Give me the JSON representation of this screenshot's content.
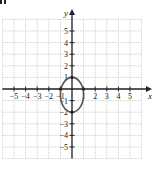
{
  "problem_label_fragment": "y.",
  "chart_data": {
    "type": "line",
    "title": "",
    "xlabel": "x",
    "ylabel": "y",
    "xlim": [
      -6,
      6
    ],
    "ylim": [
      -6,
      6
    ],
    "grid": true,
    "x_ticks": [
      -5,
      -4,
      -3,
      -2,
      -1,
      1,
      2,
      3,
      4,
      5
    ],
    "y_ticks": [
      5,
      4,
      3,
      2,
      1,
      -1,
      -2,
      -3,
      -4,
      -5
    ],
    "x_tick_labels": [
      "−5",
      "−4",
      "−3",
      "−2",
      "−1",
      "1",
      "2",
      "3",
      "4",
      "5"
    ],
    "y_tick_labels": [
      "5",
      "4",
      "3",
      "2",
      "1",
      "−1",
      "−2",
      "−3",
      "−4",
      "−5"
    ],
    "series": [
      {
        "name": "ellipse",
        "shape": "ellipse",
        "center": [
          0,
          -0.5
        ],
        "semi_axis_x": 1,
        "semi_axis_y": 1.5,
        "vertices": [
          [
            0,
            1
          ],
          [
            0,
            -2
          ],
          [
            -1,
            -0.5
          ],
          [
            1,
            -0.5
          ]
        ],
        "marked_points": [
          [
            0,
            1
          ],
          [
            0,
            -2
          ],
          [
            -1,
            0
          ],
          [
            1,
            0
          ]
        ],
        "color": "#555555"
      }
    ],
    "colors": {
      "grid": "#c8c8c8",
      "axis": "#222222",
      "curve": "#555555",
      "text": "#222222"
    }
  }
}
